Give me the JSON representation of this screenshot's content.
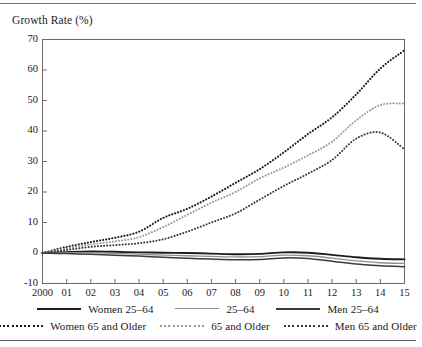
{
  "chart_data": {
    "type": "line",
    "title": "",
    "ylabel": "Growth Rate (%)",
    "xlabel": "",
    "ylim": [
      -10,
      70
    ],
    "xlim": [
      2000,
      2015
    ],
    "yticks": [
      -10,
      0,
      10,
      20,
      30,
      40,
      50,
      60,
      70
    ],
    "ytick_labels": [
      "-10",
      "0",
      "10",
      "20",
      "30",
      "40",
      "50",
      "60",
      "70"
    ],
    "grid": false,
    "legend_position": "bottom",
    "x": [
      2000,
      2001,
      2002,
      2003,
      2004,
      2005,
      2006,
      2007,
      2008,
      2009,
      2010,
      2011,
      2012,
      2013,
      2014,
      2015
    ],
    "xtick_labels": [
      "2000",
      "01",
      "02",
      "03",
      "04",
      "05",
      "06",
      "07",
      "08",
      "09",
      "10",
      "11",
      "12",
      "13",
      "14",
      "15"
    ],
    "series": [
      {
        "name": "Women 25-64",
        "style": "solid",
        "color": "#1c1c1c",
        "width": 1.9,
        "values": [
          0.0,
          0.3,
          0.5,
          0.4,
          0.2,
          0.1,
          0.0,
          -0.2,
          -0.4,
          -0.3,
          0.2,
          0.1,
          -0.6,
          -1.4,
          -1.9,
          -2.1
        ]
      },
      {
        "name": "25-64",
        "style": "solid",
        "color": "#8f8f8f",
        "width": 1.3,
        "values": [
          0.0,
          0.1,
          0.1,
          -0.1,
          -0.4,
          -0.7,
          -0.9,
          -1.1,
          -1.3,
          -1.2,
          -0.7,
          -0.9,
          -1.7,
          -2.6,
          -3.2,
          -3.4
        ]
      },
      {
        "name": "Men 25-64",
        "style": "solid",
        "color": "#3a3a3a",
        "width": 1.5,
        "values": [
          0.0,
          -0.2,
          -0.4,
          -0.7,
          -1.0,
          -1.4,
          -1.7,
          -2.0,
          -2.2,
          -2.1,
          -1.6,
          -1.8,
          -2.7,
          -3.6,
          -4.2,
          -4.5
        ]
      },
      {
        "name": "Women 65 and Older",
        "style": "dotted",
        "color": "#1c1c1c",
        "width": 2.1,
        "values": [
          0.0,
          2.0,
          3.6,
          5.0,
          7.0,
          11.5,
          14.5,
          18.5,
          23.0,
          27.5,
          33.0,
          39.0,
          44.5,
          52.0,
          60.5,
          66.5
        ]
      },
      {
        "name": "65 and Older",
        "style": "dotted",
        "color": "#9a9a9a",
        "width": 2.0,
        "values": [
          0.0,
          1.5,
          2.8,
          3.8,
          5.2,
          8.5,
          12.5,
          16.5,
          20.0,
          24.5,
          28.0,
          32.0,
          36.5,
          43.5,
          48.5,
          49.0
        ]
      },
      {
        "name": "Men 65 and Older",
        "style": "dotted",
        "color": "#3a3a3a",
        "width": 2.0,
        "values": [
          0.0,
          1.0,
          2.0,
          2.6,
          3.2,
          4.5,
          7.0,
          10.0,
          13.0,
          17.5,
          22.0,
          26.0,
          30.5,
          37.5,
          39.5,
          34.0
        ]
      }
    ]
  },
  "legend": {
    "rows": [
      [
        {
          "label": "Women 25–64",
          "swatch": "solid-dark"
        },
        {
          "label": "25–64",
          "swatch": "solid-light"
        },
        {
          "label": "Men 25–64",
          "swatch": "solid-mid"
        }
      ],
      [
        {
          "label": "Women 65 and Older",
          "swatch": "dotted-dark"
        },
        {
          "label": "65 and Older",
          "swatch": "dotted-light"
        },
        {
          "label": "Men 65 and Older",
          "swatch": "dotted-mid"
        }
      ]
    ]
  }
}
